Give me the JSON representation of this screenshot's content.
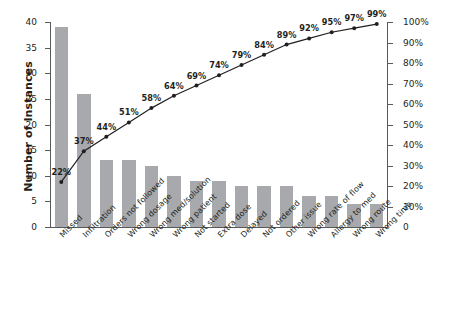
{
  "chart_data": {
    "type": "bar",
    "title": "",
    "subtitle": "",
    "xlabel": "",
    "ylabel": "Number of Instances",
    "y2label": "",
    "ylim": [
      0,
      40
    ],
    "y2lim": [
      0,
      100
    ],
    "grid": false,
    "legend": null,
    "categories": [
      "Missed",
      "Infiltration",
      "Orders not followed",
      "Wrong dosage",
      "Wrong med/solution",
      "Wrong patient",
      "Not started",
      "Extra dose",
      "Delayed",
      "Not ordered",
      "Other issue",
      "Wrong rate of flow",
      "Allergy to med",
      "Wrong route",
      "Wrong time"
    ],
    "values": [
      39,
      26,
      13,
      13,
      12,
      10,
      9,
      9,
      8,
      8,
      8,
      6,
      6,
      4.5,
      4.5
    ],
    "series": [
      {
        "name": "Number of Instances",
        "type": "bar",
        "values": [
          39,
          26,
          13,
          13,
          12,
          10,
          9,
          9,
          8,
          8,
          8,
          6,
          6,
          4.5,
          4.5
        ],
        "color": "#a7a9ac",
        "axis": "left"
      },
      {
        "name": "Cumulative Percent",
        "type": "line",
        "values": [
          22,
          37,
          44,
          51,
          58,
          64,
          69,
          74,
          79,
          84,
          89,
          92,
          95,
          97,
          99
        ],
        "labels": [
          "22%",
          "37%",
          "44%",
          "51%",
          "58%",
          "64%",
          "69%",
          "74%",
          "79%",
          "84%",
          "89%",
          "92%",
          "95%",
          "97%",
          "99%"
        ],
        "color": "#231f20",
        "axis": "right"
      }
    ],
    "yticks": [
      0,
      5,
      10,
      15,
      20,
      25,
      30,
      35,
      40
    ],
    "yticklabels": [
      "0",
      "5",
      "10",
      "15",
      "20",
      "25",
      "30",
      "35",
      "40"
    ],
    "y2ticks": [
      0,
      10,
      20,
      30,
      40,
      50,
      60,
      70,
      80,
      90,
      100
    ],
    "y2ticklabels": [
      "0",
      "10%",
      "20%",
      "30%",
      "40%",
      "50%",
      "60%",
      "70%",
      "80%",
      "90%",
      "100%"
    ],
    "colors": {
      "bar": "#a7a9ac",
      "line": "#231f20",
      "axis": "#58595b",
      "text": "#231f20",
      "background": "#ffffff"
    }
  }
}
